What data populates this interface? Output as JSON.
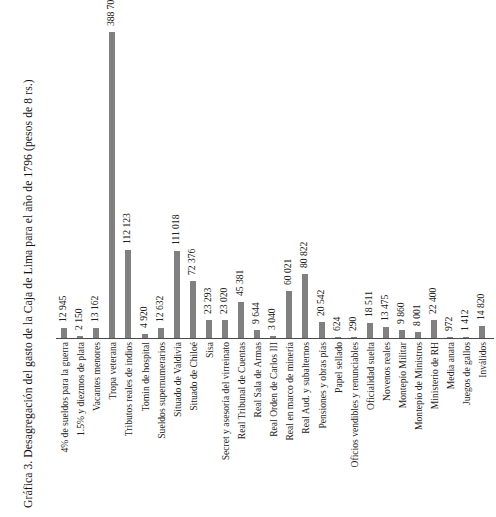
{
  "chart_data": {
    "type": "bar",
    "title": "Gráfica 3. Desagregación del gasto de la Caja de Lima para el año de 1796 (pesos de 8 rs.)",
    "xlabel": "",
    "ylabel": "",
    "ylim": [
      0,
      388709
    ],
    "grid": false,
    "legend": "none",
    "orientation": "vertical",
    "bar_color": "#808080",
    "value_label_format": "space-separated thousands",
    "categories": [
      "4% de sueldos para la guerra",
      "1.5% y diezmos de plata",
      "Vacantes menores",
      "Tropa veterana",
      "Tributos reales de indios",
      "Tomin de hospital",
      "Sueldos supernumerarios",
      "Situado de Valdivia",
      "Situado de Chiloé",
      "Sisa",
      "Secret y asesoría del virreinato",
      "Real Tribunal de Cuentas",
      "Real Sala de Armas",
      "Real Orden de Carlos III",
      "Real en marco de minería",
      "Real Aud. y subalternos",
      "Pensiones y obras pías",
      "Papel sellado",
      "Oficios vendibles y renunciables",
      "Oficialidad suelta",
      "Novenos reales",
      "Montepío Militar",
      "Montepío de Ministros",
      "Ministerio de RH",
      "Media anata",
      "Juegos de gallos",
      "Inválidos"
    ],
    "values": [
      12945,
      2150,
      13162,
      388709,
      112123,
      4920,
      12632,
      111018,
      72376,
      23293,
      23020,
      45381,
      9644,
      3040,
      60021,
      80822,
      20542,
      624,
      290,
      18511,
      13475,
      9860,
      8001,
      22400,
      972,
      1412,
      14820
    ],
    "value_labels": [
      "12 945",
      "2 150",
      "13 162",
      "388 709",
      "112 123",
      "4 920",
      "12 632",
      "111 018",
      "72 376",
      "23 293",
      "23 020",
      "45 381",
      "9 644",
      "3 040",
      "60 021",
      "80 822",
      "20 542",
      "624",
      "290",
      "18 511",
      "13 475",
      "9 860",
      "8 001",
      "22 400",
      "972",
      "1 412",
      "14 820"
    ]
  }
}
